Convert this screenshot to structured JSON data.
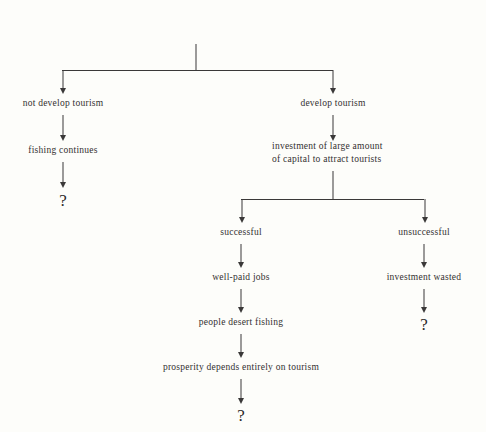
{
  "diagram": {
    "type": "decision-tree-flowchart",
    "title_line1": "FUTURE OF",
    "title_line2": "SANTA CLARA",
    "background_color": "#fdfdfa",
    "line_color": "#3a3838",
    "text_color": "#333030",
    "nodes": {
      "root": "FUTURE OF SANTA CLARA",
      "branch_no_tourism": "not develop tourism",
      "fishing_continues": "fishing continues",
      "question_left": "?",
      "branch_develop_tourism": "develop tourism",
      "investment_line1": "investment of large amount",
      "investment_line2": "of capital to attract tourists",
      "successful": "successful",
      "unsuccessful": "unsuccessful",
      "well_paid_jobs": "well-paid jobs",
      "investment_wasted": "investment wasted",
      "question_right": "?",
      "people_desert_fishing": "people desert fishing",
      "prosperity": "prosperity depends entirely on tourism",
      "question_bottom": "?"
    },
    "edges": [
      {
        "from": "root",
        "to": "branch_no_tourism",
        "style": "elbow-arrow"
      },
      {
        "from": "root",
        "to": "branch_develop_tourism",
        "style": "elbow-arrow"
      },
      {
        "from": "branch_no_tourism",
        "to": "fishing_continues",
        "style": "straight-arrow"
      },
      {
        "from": "fishing_continues",
        "to": "question_left",
        "style": "straight-arrow"
      },
      {
        "from": "branch_develop_tourism",
        "to": "investment",
        "style": "straight-arrow"
      },
      {
        "from": "investment",
        "to": "successful",
        "style": "elbow-arrow"
      },
      {
        "from": "investment",
        "to": "unsuccessful",
        "style": "elbow-arrow"
      },
      {
        "from": "successful",
        "to": "well_paid_jobs",
        "style": "straight-arrow"
      },
      {
        "from": "unsuccessful",
        "to": "investment_wasted",
        "style": "straight-arrow"
      },
      {
        "from": "investment_wasted",
        "to": "question_right",
        "style": "straight-arrow"
      },
      {
        "from": "well_paid_jobs",
        "to": "people_desert_fishing",
        "style": "straight-arrow"
      },
      {
        "from": "people_desert_fishing",
        "to": "prosperity",
        "style": "straight-arrow"
      },
      {
        "from": "prosperity",
        "to": "question_bottom",
        "style": "straight-arrow"
      }
    ]
  }
}
